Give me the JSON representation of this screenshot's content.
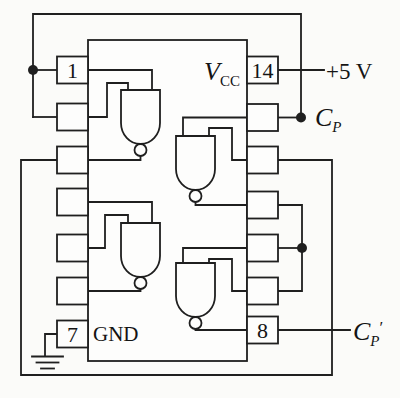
{
  "ic": {
    "vcc_label": {
      "base": "V",
      "sub": "CC"
    },
    "gnd_label": "GND",
    "pin_labels": {
      "p1": "1",
      "p7": "7",
      "p8": "8",
      "p14": "14"
    }
  },
  "signals": {
    "supply_label": "+5 V",
    "cp_label": {
      "base": "C",
      "sub": "P"
    },
    "cp_prime_label": {
      "base": "C",
      "sub": "P",
      "prime": "′"
    }
  },
  "colors": {
    "line": "#1f1f1f",
    "background": "#fbfbf9"
  }
}
